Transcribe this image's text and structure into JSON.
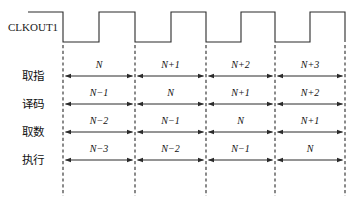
{
  "figure": {
    "type": "timing-diagram",
    "background_color": "#ffffff",
    "line_color": "#2b2b2b",
    "text_color": "#111111"
  },
  "clock": {
    "label": "CLKOUT1",
    "waveform": "square",
    "cycles": 4.5,
    "starts": "high",
    "high_y": 12,
    "low_y": 42,
    "edges_x": [
      28,
      63,
      99,
      135,
      171,
      206,
      241,
      275,
      310,
      345
    ]
  },
  "grid": {
    "dashed_lines_x": [
      63,
      135,
      206,
      275,
      345
    ],
    "dash_top_y": 45,
    "dash_bottom_y": 196
  },
  "rows": [
    {
      "label": "取指",
      "label_en": "instruction-fetch",
      "arrow_y": 76,
      "text_y": 68,
      "cells": [
        "N",
        "N+1",
        "N+2",
        "N+3"
      ]
    },
    {
      "label": "译码",
      "label_en": "decode",
      "arrow_y": 104,
      "text_y": 96,
      "cells": [
        "N−1",
        "N",
        "N+1",
        "N+2"
      ]
    },
    {
      "label": "取数",
      "label_en": "operand-fetch",
      "arrow_y": 132,
      "text_y": 124,
      "cells": [
        "N−2",
        "N−1",
        "N",
        "N+1"
      ]
    },
    {
      "label": "执行",
      "label_en": "execute",
      "arrow_y": 160,
      "text_y": 152,
      "cells": [
        "N−3",
        "N−2",
        "N−1",
        "N"
      ]
    }
  ],
  "columns": [
    {
      "start_x": 63,
      "end_x": 135
    },
    {
      "start_x": 135,
      "end_x": 206
    },
    {
      "start_x": 206,
      "end_x": 275
    },
    {
      "start_x": 275,
      "end_x": 345
    }
  ]
}
